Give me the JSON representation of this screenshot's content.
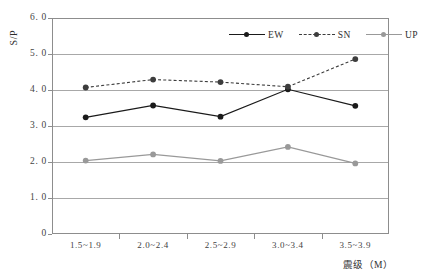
{
  "chart_data": {
    "type": "line",
    "title": "",
    "xlabel": "震级（M）",
    "ylabel": "S/P",
    "categories": [
      "1.5~1.9",
      "2.0~2.4",
      "2.5~2.9",
      "3.0~3.4",
      "3.5~3.9"
    ],
    "ylim": [
      0,
      6.0
    ],
    "ytick_labels": [
      "6. 0",
      "5. 0",
      "4. 0",
      "3. 0",
      "2. 0",
      "1. 0",
      "0"
    ],
    "ytick_values": [
      6.0,
      5.0,
      4.0,
      3.0,
      2.0,
      1.0,
      0
    ],
    "grid": true,
    "legend_position": "top-right-inside",
    "series": [
      {
        "name": "EW",
        "values": [
          3.24,
          3.57,
          3.26,
          4.02,
          3.56
        ],
        "color": "#1a1a1a",
        "linestyle": "solid",
        "marker": "filled-circle"
      },
      {
        "name": "SN",
        "values": [
          4.07,
          4.29,
          4.22,
          4.09,
          4.86
        ],
        "color": "#3d3d3d",
        "linestyle": "dotted",
        "marker": "filled-circle"
      },
      {
        "name": "UP",
        "values": [
          2.04,
          2.21,
          2.03,
          2.42,
          1.96
        ],
        "color": "#999999",
        "linestyle": "solid",
        "marker": "filled-circle"
      }
    ]
  },
  "axes": {
    "y_title": "S/P",
    "x_title": "震级（M）"
  },
  "colors": {
    "frame": "#8d8d8d",
    "grid": "#a8a8a8",
    "ew": "#1a1a1a",
    "sn": "#3d3d3d",
    "up": "#999999",
    "background": "#ffffff"
  }
}
